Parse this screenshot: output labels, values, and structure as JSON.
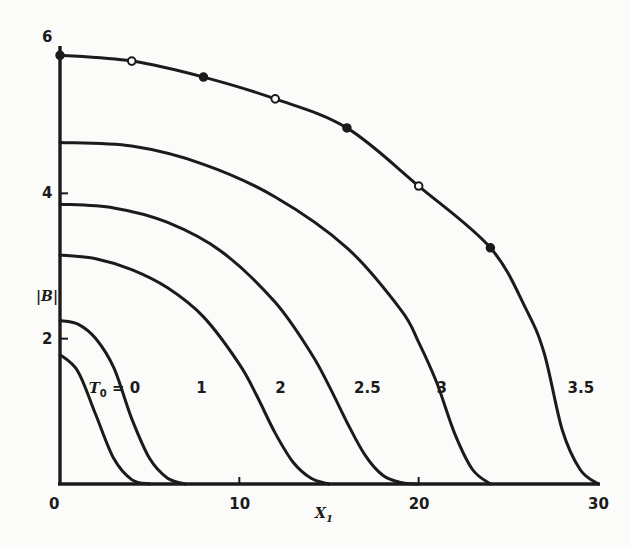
{
  "chart_data": {
    "type": "line",
    "title": "",
    "xlabel": "X1",
    "ylabel": "|B|",
    "xlim": [
      0,
      30
    ],
    "ylim": [
      0,
      6
    ],
    "grid": false,
    "legend": "inline curve labels",
    "x_ticks": [
      0,
      10,
      20,
      30
    ],
    "x_tick_labels": [
      "0",
      "10",
      "20",
      "30"
    ],
    "y_ticks": [
      2,
      4,
      6
    ],
    "y_tick_labels": [
      "2",
      "4",
      "6"
    ],
    "series": [
      {
        "name": "T0 = 0",
        "label": "T₀ = 0",
        "x": [
          0,
          1,
          2,
          3,
          4,
          5
        ],
        "y": [
          1.78,
          1.55,
          0.95,
          0.35,
          0.06,
          0
        ],
        "label_pos": [
          4.5,
          1.25
        ]
      },
      {
        "name": "1",
        "label": "1",
        "x": [
          0,
          1,
          2,
          3,
          4,
          5,
          6,
          7
        ],
        "y": [
          2.25,
          2.2,
          2.0,
          1.6,
          0.9,
          0.35,
          0.08,
          0
        ],
        "label_pos": [
          7.6,
          1.25
        ]
      },
      {
        "name": "2",
        "label": "2",
        "x": [
          0,
          2,
          4,
          6,
          8,
          10,
          11,
          12,
          13,
          14,
          15
        ],
        "y": [
          3.15,
          3.1,
          2.95,
          2.7,
          2.3,
          1.65,
          1.2,
          0.7,
          0.3,
          0.08,
          0
        ],
        "label_pos": [
          12.0,
          1.25
        ]
      },
      {
        "name": "2.5",
        "label": "2.5",
        "x": [
          0,
          3,
          6,
          9,
          12,
          14,
          15,
          16,
          17,
          18,
          19,
          20
        ],
        "y": [
          3.85,
          3.8,
          3.6,
          3.2,
          2.5,
          1.8,
          1.35,
          0.85,
          0.4,
          0.12,
          0.02,
          0
        ],
        "label_pos": [
          16.4,
          1.25
        ]
      },
      {
        "name": "3",
        "label": "3",
        "x": [
          0,
          4,
          8,
          12,
          16,
          19,
          20,
          21,
          22,
          23,
          24
        ],
        "y": [
          4.7,
          4.65,
          4.4,
          3.95,
          3.25,
          2.4,
          1.95,
          1.4,
          0.7,
          0.2,
          0
        ],
        "label_pos": [
          21.0,
          1.25
        ]
      },
      {
        "name": "3.5",
        "label": "3.5",
        "x": [
          0,
          4,
          8,
          12,
          16,
          20,
          24,
          26,
          27,
          28,
          29,
          30
        ],
        "y": [
          5.9,
          5.82,
          5.6,
          5.3,
          4.9,
          4.1,
          3.25,
          2.4,
          1.8,
          0.75,
          0.2,
          0
        ],
        "label_pos": [
          28.3,
          1.25
        ]
      }
    ],
    "markers": [
      {
        "x": 0,
        "y": 5.9,
        "style": "filled"
      },
      {
        "x": 4,
        "y": 5.82,
        "style": "open"
      },
      {
        "x": 8,
        "y": 5.6,
        "style": "filled"
      },
      {
        "x": 12,
        "y": 5.3,
        "style": "open"
      },
      {
        "x": 16,
        "y": 4.9,
        "style": "filled"
      },
      {
        "x": 20,
        "y": 4.1,
        "style": "open"
      },
      {
        "x": 24,
        "y": 3.25,
        "style": "filled"
      }
    ]
  },
  "labels": {
    "x_axis": "X",
    "x_axis_sub": "1",
    "y_axis": "|B|",
    "curve0_main": "T",
    "curve0_sub": "0",
    "curve0_rest": " = 0"
  }
}
